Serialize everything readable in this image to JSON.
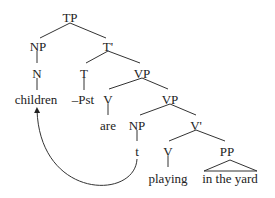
{
  "diagram": {
    "type": "syntax-tree",
    "nodes": {
      "tp": "TP",
      "np1": "NP",
      "tbar": "T'",
      "n": "N",
      "t": "T",
      "vp1": "VP",
      "children": "children",
      "pst": "–Pst",
      "v1": "V",
      "vp2": "VP",
      "are": "are",
      "np2": "NP",
      "vbar": "V'",
      "trace": "t",
      "v2": "V",
      "pp": "PP",
      "playing": "playing",
      "yard": "in the yard"
    },
    "movement_arrow": {
      "from": "trace",
      "to": "children"
    }
  }
}
